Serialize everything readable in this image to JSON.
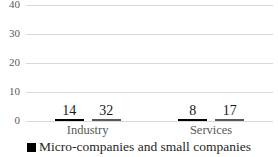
{
  "chart_data": {
    "type": "bar",
    "categories": [
      "Industry",
      "Services"
    ],
    "series": [
      {
        "name": "Micro-companies and small companies",
        "color": "#000000",
        "border_color": "#000000",
        "values": [
          14,
          8
        ]
      },
      {
        "name": "",
        "color": "#c9c9c9",
        "border_color": "#595959",
        "values": [
          32,
          17
        ]
      }
    ],
    "title": "",
    "xlabel": "",
    "ylabel": "",
    "ylim": [
      0,
      40
    ],
    "yticks": [
      0,
      10,
      20,
      30,
      40
    ],
    "grid": true,
    "data_labels": true,
    "legend_position": "bottom"
  },
  "legend": {
    "items": [
      {
        "label": "Micro-companies and small companies",
        "swatch_color": "#000000"
      }
    ]
  },
  "colors": {
    "background": "#ffffff",
    "grid": "#d9d9d9",
    "tick_label": "#595959",
    "category_label": "#595959",
    "data_label": "#1a1a1a",
    "legend_text": "#262626"
  }
}
